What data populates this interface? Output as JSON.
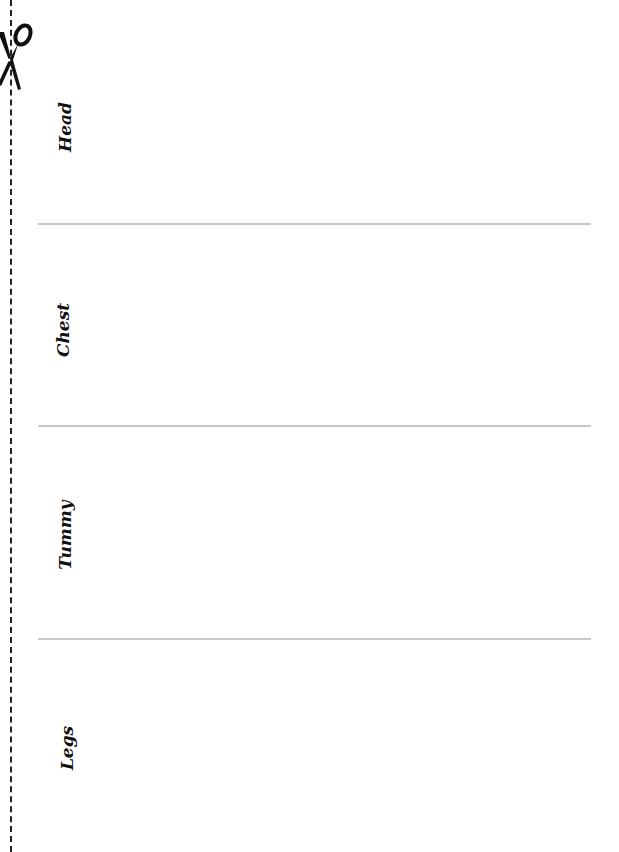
{
  "document": {
    "sections": [
      {
        "label": "Head"
      },
      {
        "label": "Chest"
      },
      {
        "label": "Tummy"
      },
      {
        "label": "Legs"
      }
    ],
    "icons": {
      "scissors": "scissors-icon"
    },
    "colors": {
      "divider": "#c8c8c8",
      "text": "#111111",
      "cut_line": "#222222"
    }
  }
}
